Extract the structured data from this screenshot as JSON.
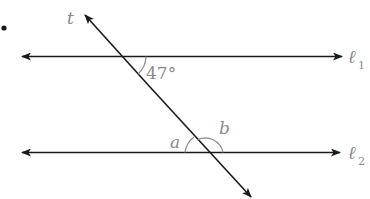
{
  "diagram": {
    "type": "parallel-lines-transversal",
    "bullet": "•",
    "lines": {
      "l1": {
        "label": "ℓ",
        "subscript": "1"
      },
      "l2": {
        "label": "ℓ",
        "subscript": "2"
      },
      "transversal": {
        "label": "t"
      }
    },
    "angles": {
      "given": {
        "value": "47°"
      },
      "a": {
        "label": "a"
      },
      "b": {
        "label": "b"
      }
    },
    "colors": {
      "line": "#1a1a1a",
      "label": "#8a8a8a",
      "arc": "#8a8a8a"
    }
  }
}
